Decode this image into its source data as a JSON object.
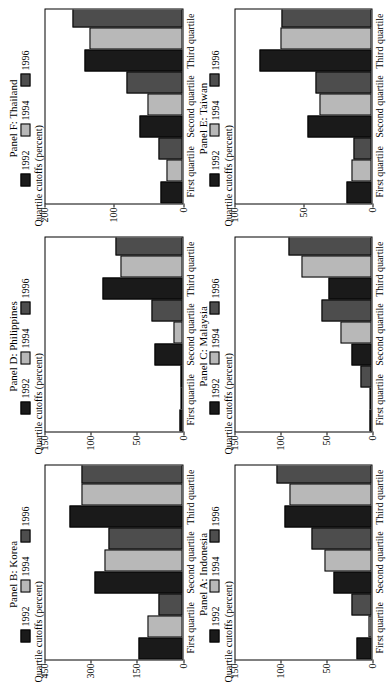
{
  "figure": {
    "axis_title": "Quartile cutoffs (percent)",
    "categories": [
      "First quartile",
      "Second quartile",
      "Third quartile"
    ],
    "series_names": [
      "1992",
      "1994",
      "1996"
    ],
    "colors": {
      "1992": "#1a1a1a",
      "1994": "#b8b8b8",
      "1996": "#4d4d4d",
      "axis": "#000000",
      "background": "#ffffff"
    }
  },
  "chart_data": [
    {
      "type": "bar",
      "title": "Panel A: Indonesia",
      "xlabel": "",
      "ylabel": "Quartile cutoffs (percent)",
      "categories": [
        "First quartile",
        "Second quartile",
        "Third quartile"
      ],
      "series": [
        {
          "name": "1992",
          "values": [
            16,
            42,
            96
          ]
        },
        {
          "name": "1994",
          "values": [
            3,
            52,
            90
          ]
        },
        {
          "name": "1996",
          "values": [
            22,
            66,
            104
          ]
        }
      ],
      "ylim": [
        0,
        150
      ],
      "yticks": [
        0,
        50,
        100,
        150
      ],
      "grid": false,
      "legend": "top"
    },
    {
      "type": "bar",
      "title": "Panel B: Korea",
      "xlabel": "",
      "ylabel": "Quartile cutoffs (percent)",
      "categories": [
        "First quartile",
        "Second quartile",
        "Third quartile"
      ],
      "series": [
        {
          "name": "1992",
          "values": [
            143,
            290,
            372
          ]
        },
        {
          "name": "1994",
          "values": [
            113,
            256,
            330
          ]
        },
        {
          "name": "1996",
          "values": [
            78,
            243,
            330
          ]
        }
      ],
      "ylim": [
        0,
        450
      ],
      "yticks": [
        0,
        150,
        300,
        450
      ],
      "grid": false,
      "legend": "top"
    },
    {
      "type": "bar",
      "title": "Panel C: Malaysia",
      "xlabel": "",
      "ylabel": "Quartile cutoffs (percent)",
      "categories": [
        "First quartile",
        "Second quartile",
        "Third quartile"
      ],
      "series": [
        {
          "name": "1992",
          "values": [
            1,
            22,
            47
          ]
        },
        {
          "name": "1994",
          "values": [
            2,
            34,
            77
          ]
        },
        {
          "name": "1996",
          "values": [
            12,
            55,
            91
          ]
        }
      ],
      "ylim": [
        0,
        150
      ],
      "yticks": [
        0,
        50,
        100,
        150
      ],
      "grid": false,
      "legend": "top"
    },
    {
      "type": "bar",
      "title": "Panel D: Philippines",
      "xlabel": "",
      "ylabel": "Quartile cutoffs (percent)",
      "categories": [
        "First quartile",
        "Second quartile",
        "Third quartile"
      ],
      "series": [
        {
          "name": "1992",
          "values": [
            3,
            30,
            87
          ]
        },
        {
          "name": "1994",
          "values": [
            1,
            9,
            68
          ]
        },
        {
          "name": "1996",
          "values": [
            2,
            34,
            73
          ]
        }
      ],
      "ylim": [
        0,
        150
      ],
      "yticks": [
        0,
        50,
        100,
        150
      ],
      "grid": false,
      "legend": "top"
    },
    {
      "type": "bar",
      "title": "Panel E: Taiwan",
      "xlabel": "",
      "ylabel": "Quartile cutoffs (percent)",
      "categories": [
        "First quartile",
        "Second quartile",
        "Third quartile"
      ],
      "series": [
        {
          "name": "1992",
          "values": [
            18,
            47,
            82
          ]
        },
        {
          "name": "1994",
          "values": [
            15,
            38,
            67
          ]
        },
        {
          "name": "1996",
          "values": [
            13,
            41,
            66
          ]
        }
      ],
      "ylim": [
        0,
        100
      ],
      "yticks": [
        0,
        50,
        100
      ],
      "grid": false,
      "legend": "top"
    },
    {
      "type": "bar",
      "title": "Panel F: Thailand",
      "xlabel": "",
      "ylabel": "Quartile cutoffs (percent)",
      "categories": [
        "First quartile",
        "Second quartile",
        "Third quartile"
      ],
      "series": [
        {
          "name": "1992",
          "values": [
            31,
            62,
            143
          ]
        },
        {
          "name": "1994",
          "values": [
            23,
            51,
            135
          ]
        },
        {
          "name": "1996",
          "values": [
            34,
            82,
            160
          ]
        }
      ],
      "ylim": [
        0,
        200
      ],
      "yticks": [
        0,
        100,
        200
      ],
      "grid": false,
      "legend": "top"
    }
  ]
}
